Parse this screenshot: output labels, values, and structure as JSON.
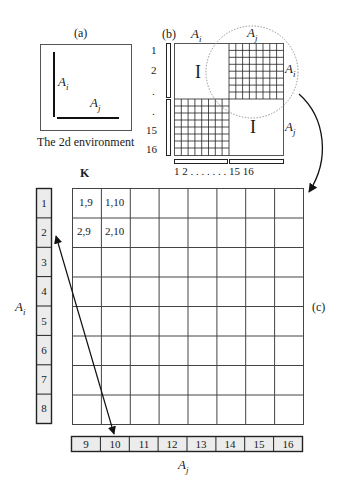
{
  "panel_a": {
    "label": "(a)",
    "axis_vertical": "A",
    "axis_vertical_sub": "i",
    "axis_horizontal": "A",
    "axis_horizontal_sub": "j",
    "caption": "The 2d environment"
  },
  "panel_b": {
    "label": "(b)",
    "top_left": {
      "base": "A",
      "sub": "i"
    },
    "top_right": {
      "base": "A",
      "sub": "j"
    },
    "right_top": {
      "base": "A",
      "sub": "i"
    },
    "right_bottom": {
      "base": "A",
      "sub": "j"
    },
    "identity_top": "I",
    "identity_bottom": "I",
    "row_labels": [
      "1",
      "2",
      ".",
      ".",
      "15",
      "16"
    ],
    "col_labels": "1 2 . . . . . . . 15 16"
  },
  "panel_c": {
    "label": "(c)",
    "matrix_label": "K",
    "cells": [
      [
        "1,9",
        "1,10"
      ],
      [
        "2,9",
        "2,10"
      ]
    ],
    "row_bar": [
      "1",
      "2",
      "3",
      "4",
      "5",
      "6",
      "7",
      "8"
    ],
    "col_bar": [
      "9",
      "10",
      "11",
      "12",
      "13",
      "14",
      "15",
      "16"
    ],
    "row_axis": {
      "base": "A",
      "sub": "i"
    },
    "col_axis": {
      "base": "A",
      "sub": "j"
    }
  }
}
